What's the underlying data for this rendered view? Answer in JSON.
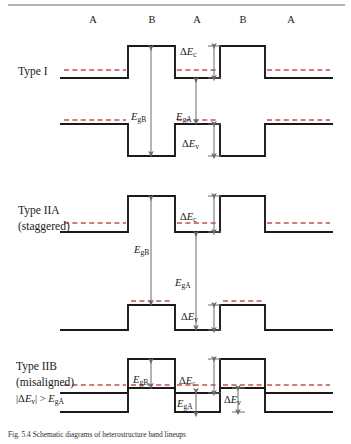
{
  "figure": {
    "top_rule_color": "#9a9a9a",
    "band_color": "#1a1a1a",
    "fermi_color": "#c0504d",
    "arrow_color": "#6b6b6b",
    "region_labels": [
      "A",
      "B",
      "A",
      "B",
      "A"
    ],
    "region_label_x": [
      93,
      152,
      197,
      243,
      291
    ],
    "region_label_y": 20
  },
  "rows": [
    {
      "name": "type-i",
      "title_lines": [
        "Type I"
      ],
      "title_x": 18,
      "title_y": [
        71
      ],
      "annotations": [
        {
          "id": "delta-ec",
          "text": "ΔE",
          "sub": "c",
          "x": 193,
          "y": 52
        },
        {
          "id": "egb",
          "text": "E",
          "sub": "gB",
          "x": 137,
          "y": 117
        },
        {
          "id": "ega",
          "text": "E",
          "sub": "gA",
          "x": 182,
          "y": 117
        },
        {
          "id": "delta-ev",
          "text": "ΔE",
          "sub": "v",
          "x": 196,
          "y": 150
        }
      ]
    },
    {
      "name": "type-iia",
      "title_lines": [
        "Type IIA",
        "(staggered)"
      ],
      "title_x": 18,
      "title_y": [
        210,
        226
      ],
      "annotations": [
        {
          "id": "delta-ec",
          "text": "ΔE",
          "sub": "c",
          "x": 193,
          "y": 216
        },
        {
          "id": "egb",
          "text": "E",
          "sub": "gB",
          "x": 148,
          "y": 250
        },
        {
          "id": "ega",
          "text": "E",
          "sub": "gA",
          "x": 184,
          "y": 282
        },
        {
          "id": "delta-ev",
          "text": "ΔE",
          "sub": "v",
          "x": 197,
          "y": 305
        }
      ]
    },
    {
      "name": "type-iib",
      "title_lines": [
        "Type IIB",
        "(misaligned)",
        "|ΔE_v| > E_gA"
      ],
      "title_x": 16,
      "title_y": [
        366,
        382,
        398
      ],
      "annotations": [
        {
          "id": "egb",
          "text": "E",
          "sub": "gB",
          "x": 142,
          "y": 380
        },
        {
          "id": "delta-ec",
          "text": "ΔE",
          "sub": "c",
          "x": 192,
          "y": 382
        },
        {
          "id": "ega",
          "text": "E",
          "sub": "gA",
          "x": 185,
          "y": 411
        },
        {
          "id": "delta-ev",
          "text": "ΔE",
          "sub": "v",
          "x": 234,
          "y": 402
        }
      ]
    }
  ],
  "caption": {
    "prefix": "Fig. 5.4",
    "text": "Fig. 5.4  Schematic diagrams of heterostructure band lineups"
  }
}
